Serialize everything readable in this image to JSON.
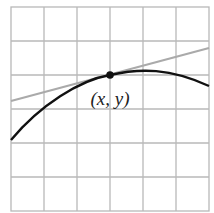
{
  "diagram": {
    "grid": {
      "columns": 6,
      "rows": 6,
      "line_color": "#b8b8b8"
    },
    "curve": {
      "color": "#111111",
      "description": "concave-down curve"
    },
    "tangent_line": {
      "color": "#aaaaaa"
    },
    "point": {
      "label": "(x, y)",
      "color": "#111111"
    }
  }
}
